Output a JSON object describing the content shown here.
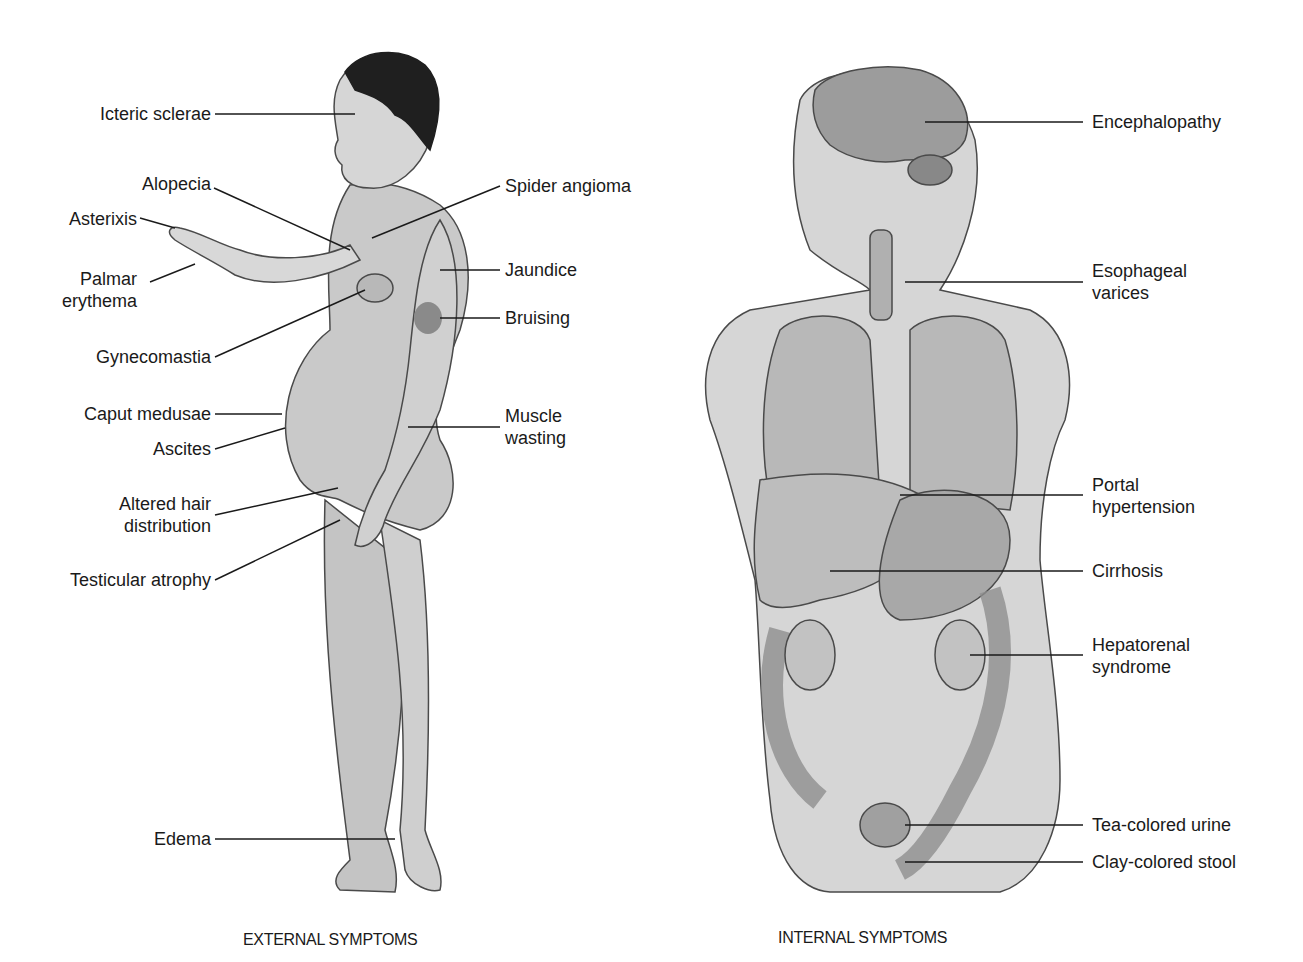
{
  "figure": {
    "colors": {
      "skin": "#c9c9c9",
      "skin_light": "#dcdcdc",
      "hair": "#1f1f1f",
      "outline": "#4a4a4a",
      "organ": "#b3b3b3",
      "organ_dark": "#8f8f8f",
      "bruise": "#8a8a8a",
      "leader_line": "#1a1a1a"
    },
    "external": {
      "caption": "EXTERNAL SYMPTOMS",
      "labels": [
        {
          "text": "Icteric sclerae"
        },
        {
          "text": "Alopecia"
        },
        {
          "text": "Asterixis"
        },
        {
          "text": "Palmar erythema"
        },
        {
          "text": "Gynecomastia"
        },
        {
          "text": "Caput medusae"
        },
        {
          "text": "Ascites"
        },
        {
          "text": "Altered hair distribution"
        },
        {
          "text": "Testicular atrophy"
        },
        {
          "text": "Edema"
        },
        {
          "text": "Spider angioma"
        },
        {
          "text": "Jaundice"
        },
        {
          "text": "Bruising"
        },
        {
          "text": "Muscle wasting"
        }
      ]
    },
    "internal": {
      "caption": "INTERNAL SYMPTOMS",
      "labels": [
        {
          "text": "Encephalopathy"
        },
        {
          "text": "Esophageal varices"
        },
        {
          "text": "Portal hypertension"
        },
        {
          "text": "Cirrhosis"
        },
        {
          "text": "Hepatorenal syndrome"
        },
        {
          "text": "Tea-colored urine"
        },
        {
          "text": "Clay-colored stool"
        }
      ]
    },
    "multiline": {
      "palmar_1": "Palmar",
      "palmar_2": "erythema",
      "altered_1": "Altered hair",
      "altered_2": "distribution",
      "muscle_1": "Muscle",
      "muscle_2": "wasting",
      "esoph_1": "Esophageal",
      "esoph_2": "varices",
      "portal_1": "Portal",
      "portal_2": "hypertension",
      "hepato_1": "Hepatorenal",
      "hepato_2": "syndrome"
    }
  }
}
